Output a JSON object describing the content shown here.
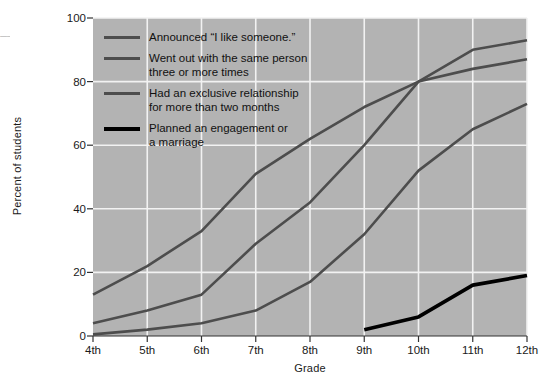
{
  "chart_data": {
    "type": "line",
    "title": "",
    "xlabel": "Grade",
    "ylabel": "Percent of students",
    "categories": [
      "4th",
      "5th",
      "6th",
      "7th",
      "8th",
      "9th",
      "10th",
      "11th",
      "12th"
    ],
    "ylim": [
      0,
      100
    ],
    "yticks": [
      0,
      20,
      40,
      60,
      80,
      100
    ],
    "grid": true,
    "legend_position": "upper-left-inside",
    "plot_background": "#b3b3b3",
    "gridline_color": "#f2f2f2",
    "series": [
      {
        "name": "Announced “I like someone.”",
        "color": "#4d4d4d",
        "values": [
          13,
          22,
          33,
          51,
          62,
          72,
          80,
          90,
          93
        ]
      },
      {
        "name": "Went out with the same person\nthree or more times",
        "color": "#4d4d4d",
        "values": [
          4,
          8,
          13,
          29,
          42,
          60,
          80,
          84,
          87
        ]
      },
      {
        "name": "Had an exclusive relationship\nfor more than two months",
        "color": "#4d4d4d",
        "values": [
          0.5,
          2,
          4,
          8,
          17,
          32,
          52,
          65,
          73
        ]
      },
      {
        "name": "Planned an engagement or\na marriage",
        "color": "#000000",
        "values": [
          null,
          null,
          null,
          null,
          null,
          2,
          6,
          16,
          19
        ]
      }
    ]
  },
  "axis": {
    "ytick_labels": [
      "0",
      "20",
      "40",
      "60",
      "80",
      "100"
    ],
    "xtick_labels": [
      "4th",
      "5th",
      "6th",
      "7th",
      "8th",
      "9th",
      "10th",
      "11th",
      "12th"
    ],
    "xlabel": "Grade",
    "ylabel": "Percent of students"
  },
  "legend": {
    "entries": [
      {
        "label": "Announced “I like someone.”",
        "color": "#4d4d4d"
      },
      {
        "label": "Went out with the same person\nthree or more times",
        "color": "#4d4d4d"
      },
      {
        "label": "Had an exclusive relationship\nfor more than two months",
        "color": "#4d4d4d"
      },
      {
        "label": "Planned an engagement or\na marriage",
        "color": "#000000"
      }
    ]
  },
  "edge_fragment": {
    "lines": "—\n—\n—"
  }
}
